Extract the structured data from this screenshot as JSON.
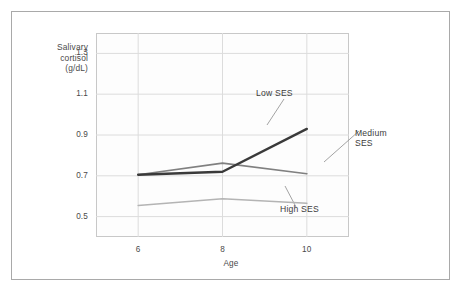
{
  "figure": {
    "y_axis_title": "Salivary\ncortisol\n(g/dL)",
    "x_axis_title": "Age"
  },
  "chart_data": {
    "type": "line",
    "title": "",
    "xlabel": "Age",
    "ylabel": "Salivary cortisol (g/dL)",
    "x": [
      6,
      8,
      10
    ],
    "categories": [
      "6",
      "8",
      "10"
    ],
    "xlim": [
      5.0,
      11.0
    ],
    "ylim": [
      0.4,
      1.4
    ],
    "yticks": [
      0.5,
      0.7,
      0.9,
      1.1,
      1.3
    ],
    "ytick_labels": [
      "0.5",
      "0.7",
      "0.9",
      "1.1",
      "1.3"
    ],
    "xticks": [
      6,
      8,
      10
    ],
    "xtick_labels": [
      "6",
      "8",
      "10"
    ],
    "grid": true,
    "legend": "inline-annotations",
    "series": [
      {
        "name": "Low SES",
        "values": [
          0.705,
          0.72,
          0.93
        ],
        "color": "#3a3a3a",
        "width": 2.4
      },
      {
        "name": "Medium SES",
        "values": [
          0.705,
          0.762,
          0.71
        ],
        "color": "#808080",
        "width": 1.7
      },
      {
        "name": "High SES",
        "values": [
          0.555,
          0.588,
          0.565
        ],
        "color": "#b4b4b4",
        "width": 1.5
      }
    ],
    "annotations": [
      {
        "name": "Low SES",
        "text": "Low SES"
      },
      {
        "name": "Medium SES",
        "text": "Medium\nSES"
      },
      {
        "name": "High SES",
        "text": "High SES"
      }
    ]
  },
  "y_tick_labels": [
    "1.3",
    "1.1",
    "0.9",
    "0.7",
    "0.5"
  ],
  "x_tick_labels": [
    "6",
    "8",
    "10"
  ],
  "annotations": {
    "low": "Low SES",
    "medium": "Medium\nSES",
    "high": "High SES"
  },
  "colors": {
    "frame": "#a9a9a9",
    "plot_border": "#c8c8c8",
    "gridline": "#dcdcdc",
    "text": "#4a4a4a",
    "low_ses": "#3a3a3a",
    "medium_ses": "#808080",
    "high_ses": "#b4b4b4",
    "background": "#ffffff"
  }
}
